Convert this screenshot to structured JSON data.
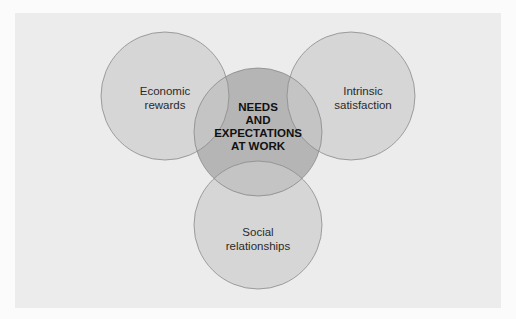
{
  "diagram": {
    "type": "venn",
    "center": {
      "label_lines": [
        "NEEDS",
        "AND",
        "EXPECTATIONS",
        "AT WORK"
      ]
    },
    "circles": [
      {
        "id": "economic",
        "label_lines": [
          "Economic",
          "rewards"
        ]
      },
      {
        "id": "intrinsic",
        "label_lines": [
          "Intrinsic",
          "satisfaction"
        ]
      },
      {
        "id": "social",
        "label_lines": [
          "Social",
          "relationships"
        ]
      }
    ],
    "colors": {
      "panel": "#ececec",
      "outer_circle": "#d6d6d6",
      "center_circle": "#b3b3b3",
      "overlap": "#c2c2c2",
      "stroke": "#8a8a8a"
    }
  }
}
